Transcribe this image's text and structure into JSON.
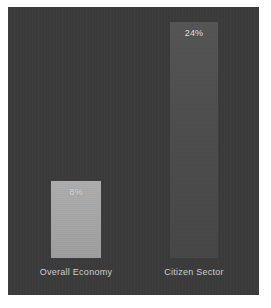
{
  "chart_data": {
    "type": "bar",
    "title": "",
    "subtitle": "",
    "xlabel": "",
    "ylabel": "",
    "categories": [
      "Overall Economy",
      "Citizen Sector"
    ],
    "values": [
      8,
      24
    ],
    "value_labels": [
      "8%",
      "24%"
    ],
    "unit": "%",
    "ylim": [
      0,
      26
    ],
    "grid": false,
    "legend": false,
    "legend_position": "none",
    "series": [
      {
        "name": "Growth rate",
        "values": [
          8,
          24
        ]
      }
    ],
    "bars": [
      {
        "category": "Overall Economy",
        "value": 8,
        "value_label": "8%",
        "color": "#a8a8a8"
      },
      {
        "category": "Citizen Sector",
        "value": 24,
        "value_label": "24%",
        "color": "#4d4d4d"
      }
    ],
    "colors": {
      "background": "#3a3a3a",
      "page": "#ffffff",
      "bar_light": "#a8a8a8",
      "bar_dark": "#4d4d4d",
      "value_text": "#e6e6e6",
      "category_text": "#cfcfcf"
    }
  }
}
